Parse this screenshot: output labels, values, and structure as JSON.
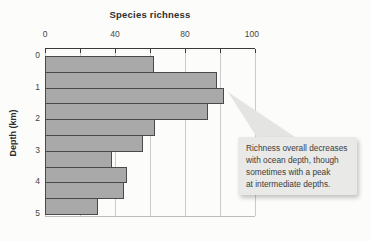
{
  "figure": {
    "title": "Species richness",
    "y_axis_title": "Depth (km)"
  },
  "callout": {
    "lines": [
      "Richness overall decreases",
      "with ocean depth, though",
      "sometimes with a peak",
      "at intermediate depths."
    ]
  },
  "chart_data": {
    "type": "bar",
    "orientation": "horizontal",
    "title": "Species richness",
    "xlabel": "Species richness",
    "ylabel": "Depth (km)",
    "categories_depth_km": [
      "0-0.5",
      "0.5-1.0",
      "1.0-1.5",
      "1.5-2.0",
      "2.0-2.5",
      "2.5-3.0",
      "3.0-3.5",
      "3.5-4.0",
      "4.0-4.5",
      "4.5-5.0"
    ],
    "values": [
      62,
      98,
      102,
      93,
      63,
      56,
      38,
      47,
      45,
      30
    ],
    "x_tick_labels": [
      "0",
      "40",
      "80",
      "100"
    ],
    "x_tick_label_fractions": [
      0,
      0.3333,
      0.6667,
      0.985
    ],
    "y_tick_labels": [
      "0",
      "1",
      "2",
      "3",
      "4",
      "5"
    ],
    "x_gridline_count": 7,
    "x_gridline_interval": 20,
    "x_axis_max": 120,
    "grid": true,
    "bar_color": "#a9a9a9",
    "bar_border_color": "#4a4a4a",
    "gridline_color": "#cbcbc9",
    "callout_bg_color": "#e9e9e7",
    "annotation": "Richness overall decreases with ocean depth, though sometimes with a peak at intermediate depths."
  }
}
